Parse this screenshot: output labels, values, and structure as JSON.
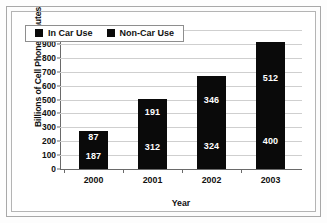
{
  "chart_data": {
    "type": "bar",
    "subtype": "stacked-bar",
    "title": "",
    "xlabel": "Year",
    "ylabel": "Billions of Cell Phone Minutes",
    "categories": [
      "2000",
      "2001",
      "2002",
      "2003"
    ],
    "series": [
      {
        "name": "Non-Car Use",
        "values": [
          187,
          312,
          324,
          400
        ],
        "color": "#0a0a0a",
        "stack_position": "bottom"
      },
      {
        "name": "In Car Use",
        "values": [
          87,
          191,
          346,
          512
        ],
        "color": "#0a0a0a",
        "stack_position": "top"
      }
    ],
    "totals": [
      274,
      503,
      670,
      912
    ],
    "ylim": [
      0,
      1000
    ],
    "ytick_step": 100,
    "ytick_labels": [
      "0",
      "100",
      "200",
      "300",
      "400",
      "500",
      "600",
      "700",
      "800",
      "900",
      "1,000"
    ],
    "grid": true,
    "grid_axis": "y",
    "legend_position": "top-left-inside",
    "data_labels": true,
    "data_label_color": "#ffffff"
  },
  "legend": {
    "items": [
      {
        "label": "In Car Use",
        "swatch": "legend-swatch-icon"
      },
      {
        "label": "Non-Car Use",
        "swatch": "legend-swatch-icon"
      }
    ]
  },
  "colors": {
    "bar": "#0a0a0a",
    "gridline": "#cfcfcf",
    "axis": "#6a6a6a",
    "frame": "#b4b4b4",
    "outer_frame": "#a8a8a8",
    "plot_background": "#ffffff",
    "page_background": "#fcfcfc",
    "label_text": "#111111",
    "data_label_text": "#ffffff"
  }
}
